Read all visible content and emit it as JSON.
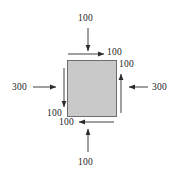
{
  "figure": {
    "type": "force-couple-diagram",
    "width": 182,
    "height": 179,
    "background_color": "#ffffff",
    "body": {
      "name": "square-block",
      "shape": "square",
      "fill_color": "#c9c9c9",
      "stroke_color": "#6e6e6e",
      "x": 67,
      "y": 60,
      "width": 50,
      "height": 57
    },
    "line_color": "#2b2b2b",
    "labels": {
      "top_outer": "100",
      "top_inner": "100",
      "right_inner": "100",
      "right_outer": "300",
      "left_outer": "300",
      "left_inner": "100",
      "bottom_inner": "100",
      "bottom_outer": "100"
    },
    "arrows": [
      {
        "name": "top-outer-arrow",
        "label": "100",
        "direction": "down",
        "from": [
          88,
          28
        ],
        "to": [
          88,
          52
        ]
      },
      {
        "name": "top-inner-arrow",
        "label": "100",
        "direction": "right",
        "from": [
          68,
          54
        ],
        "to": [
          104,
          54
        ]
      },
      {
        "name": "right-inner-arrow",
        "label": "100",
        "direction": "up",
        "from": [
          121,
          113
        ],
        "to": [
          121,
          73
        ]
      },
      {
        "name": "right-outer-arrow",
        "label": "300",
        "direction": "left",
        "from": [
          148,
          87
        ],
        "to": [
          128,
          87
        ]
      },
      {
        "name": "left-outer-arrow",
        "label": "300",
        "direction": "right",
        "from": [
          33,
          87
        ],
        "to": [
          57,
          87
        ]
      },
      {
        "name": "left-inner-arrow",
        "label": "100",
        "direction": "down",
        "from": [
          64,
          68
        ],
        "to": [
          64,
          108
        ]
      },
      {
        "name": "bottom-inner-arrow",
        "label": "100",
        "direction": "left",
        "from": [
          114,
          122
        ],
        "to": [
          78,
          122
        ]
      },
      {
        "name": "bottom-outer-arrow",
        "label": "100",
        "direction": "up",
        "from": [
          88,
          152
        ],
        "to": [
          88,
          128
        ]
      }
    ]
  }
}
